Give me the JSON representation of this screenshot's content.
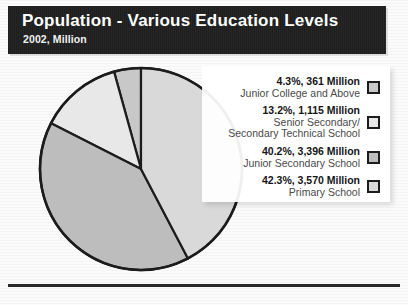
{
  "header": {
    "title": "Population - Various Education Levels",
    "subtitle": "2002, Million",
    "bar_color": "#212121",
    "title_color": "#ffffff"
  },
  "legend": {
    "items": [
      {
        "value_text": "4.3%, 361 Million",
        "label_line1": "Junior College and Above",
        "label_line2": "",
        "swatch_color": "#c8c8c8"
      },
      {
        "value_text": "13.2%, 1,115 Million",
        "label_line1": "Senior Secondary/",
        "label_line2": "Secondary Technical School",
        "swatch_color": "#e8e8e8"
      },
      {
        "value_text": "40.2%, 3,396 Million",
        "label_line1": "Junior Secondary School",
        "label_line2": "",
        "swatch_color": "#bdbdbd"
      },
      {
        "value_text": "42.3%, 3,570 Million",
        "label_line1": "Primary School",
        "label_line2": "",
        "swatch_color": "#d9d9d9"
      }
    ]
  },
  "chart_data": {
    "type": "pie",
    "title": "Population - Various Education Levels",
    "subtitle": "2002, Million",
    "unit": "Million",
    "year": "2002",
    "categories": [
      "Junior College and Above",
      "Senior Secondary/Secondary Technical School",
      "Junior Secondary School",
      "Primary School"
    ],
    "percentages": [
      4.3,
      13.2,
      40.2,
      42.3
    ],
    "values": [
      361,
      1115,
      3396,
      3570
    ],
    "value_labels": [
      "361 Million",
      "1,115 Million",
      "3,396 Million",
      "3,570 Million"
    ],
    "percent_labels": [
      "4.3%",
      "13.2%",
      "40.2%",
      "42.3%"
    ],
    "colors": [
      "#c8c8c8",
      "#e8e8e8",
      "#bdbdbd",
      "#d9d9d9"
    ],
    "slice_order": "counterclockwise from 12 o'clock",
    "legend_position": "right",
    "grid": false,
    "stroke_color": "#1c1c1c"
  }
}
